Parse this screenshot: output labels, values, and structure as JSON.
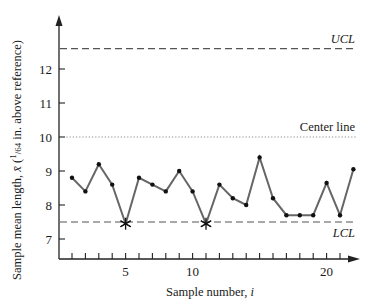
{
  "chart_data": {
    "type": "line",
    "title": "",
    "xlabel": "Sample number, i",
    "ylabel": "Sample mean length, x̄ (1/64 in. above reference)",
    "ylabel_parts": {
      "main": "Sample mean length, ",
      "xbar": "x̄",
      "frac_num": "1",
      "frac_den": "64",
      "rest": " in. above reference)"
    },
    "x": [
      1,
      2,
      3,
      4,
      5,
      6,
      7,
      8,
      9,
      10,
      11,
      12,
      13,
      14,
      15,
      16,
      17,
      18,
      19,
      20,
      21,
      22
    ],
    "values": [
      8.8,
      8.4,
      9.2,
      8.6,
      7.45,
      8.8,
      8.6,
      8.4,
      9.0,
      8.4,
      7.45,
      8.6,
      8.2,
      8.0,
      9.4,
      8.2,
      7.7,
      7.7,
      7.7,
      8.65,
      7.7,
      9.05
    ],
    "out_of_control_points": [
      5,
      11
    ],
    "x_ticks": [
      1,
      2,
      3,
      4,
      5,
      6,
      7,
      8,
      9,
      10,
      11,
      12,
      13,
      14,
      15,
      16,
      17,
      18,
      19,
      20,
      21
    ],
    "x_tick_labels": [
      {
        "x": 5,
        "label": "5"
      },
      {
        "x": 10,
        "label": "10"
      },
      {
        "x": 20,
        "label": "20"
      }
    ],
    "y_ticks": [
      7,
      8,
      9,
      10,
      11,
      12
    ],
    "y_tick_labels": [
      "7",
      "8",
      "9",
      "10",
      "11",
      "12"
    ],
    "ylim": [
      6.4,
      13.5
    ],
    "xlim": [
      0,
      23
    ],
    "grid": false,
    "legend": null,
    "control_lines": [
      {
        "name": "UCL",
        "label": "UCL",
        "value": 12.6,
        "style": "dashed",
        "label_italic": true
      },
      {
        "name": "center",
        "label": "Center line",
        "value": 10.0,
        "style": "dotted",
        "label_italic": false
      },
      {
        "name": "LCL",
        "label": "LCL",
        "value": 7.5,
        "style": "dashed",
        "label_italic": true
      }
    ],
    "colors": {
      "series": "#666666",
      "marker": "#111111",
      "axis": "#222222",
      "control": "#555555",
      "center": "#8a8a8a"
    }
  }
}
